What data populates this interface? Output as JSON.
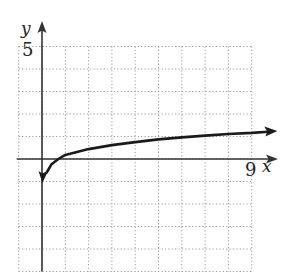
{
  "chart_data": {
    "type": "line",
    "title": "",
    "xlabel": "x",
    "ylabel": "y",
    "x_tick_labels": [
      {
        "value": 9,
        "label": "9"
      }
    ],
    "y_tick_labels": [
      {
        "value": 5,
        "label": "5"
      }
    ],
    "xlim": [
      -1,
      10
    ],
    "ylim": [
      -5,
      5
    ],
    "grid": true,
    "grid_style": "dotted",
    "grid_step": 1,
    "legend": null,
    "series": [
      {
        "name": "curve",
        "shape": "logarithmic",
        "vertical_asymptote": "x = 0",
        "x_intercept": 0.7,
        "arrows_at_both_ends": true,
        "points": [
          {
            "x": 0.02,
            "y": -1.07
          },
          {
            "x": 0.2,
            "y": -0.6
          },
          {
            "x": 0.4,
            "y": -0.25
          },
          {
            "x": 0.7,
            "y": 0.0
          },
          {
            "x": 1.0,
            "y": 0.18
          },
          {
            "x": 2.0,
            "y": 0.44
          },
          {
            "x": 3.0,
            "y": 0.62
          },
          {
            "x": 4.0,
            "y": 0.75
          },
          {
            "x": 5.0,
            "y": 0.87
          },
          {
            "x": 6.0,
            "y": 0.96
          },
          {
            "x": 7.0,
            "y": 1.04
          },
          {
            "x": 8.0,
            "y": 1.11
          },
          {
            "x": 9.0,
            "y": 1.16
          },
          {
            "x": 10.1,
            "y": 1.24
          }
        ]
      }
    ]
  },
  "labels": {
    "y_axis": "y",
    "x_axis": "x",
    "y_tick": "5",
    "x_tick": "9"
  },
  "colors": {
    "axis": "#333333",
    "curve": "#1a1a1a",
    "grid": "#9a9a9a",
    "background": "#ffffff"
  }
}
